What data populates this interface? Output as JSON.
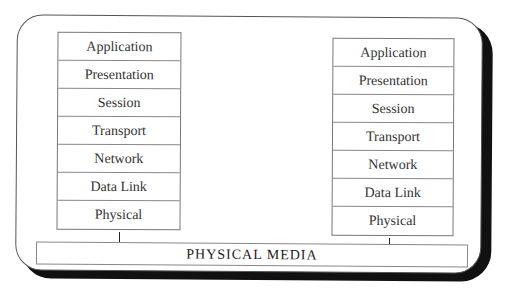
{
  "diagram": {
    "left_stack": {
      "layers": [
        "Application",
        "Presentation",
        "Session",
        "Transport",
        "Network",
        "Data Link",
        "Physical"
      ]
    },
    "right_stack": {
      "layers": [
        "Application",
        "Presentation",
        "Session",
        "Transport",
        "Network",
        "Data Link",
        "Physical"
      ]
    },
    "media_label": "PHYSICAL MEDIA"
  }
}
